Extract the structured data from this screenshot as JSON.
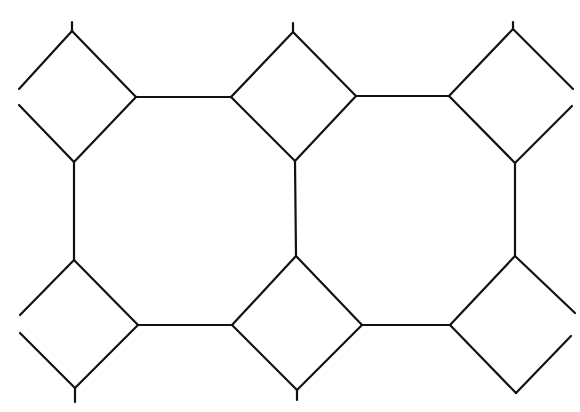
{
  "diagram": {
    "line_color": "#111111",
    "background_color": "#ffffff",
    "tiles": {
      "squares_rotated_45": 6,
      "octagons_complete": 2,
      "square_rows": 2,
      "square_columns": 3
    },
    "text_labels": []
  }
}
